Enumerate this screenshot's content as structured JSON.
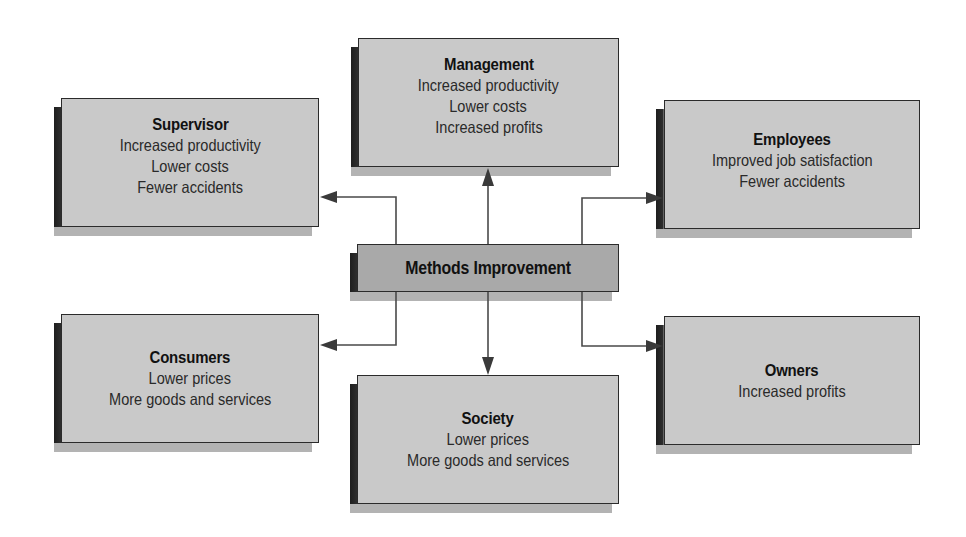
{
  "diagram": {
    "center": {
      "title": "Methods Improvement"
    },
    "nodes": [
      {
        "id": "management",
        "title": "Management",
        "lines": [
          "Increased productivity",
          "Lower costs",
          "Increased profits"
        ]
      },
      {
        "id": "supervisor",
        "title": "Supervisor",
        "lines": [
          "Increased productivity",
          "Lower costs",
          "Fewer accidents"
        ]
      },
      {
        "id": "employees",
        "title": "Employees",
        "lines": [
          "Improved job satisfaction",
          "Fewer accidents"
        ]
      },
      {
        "id": "consumers",
        "title": "Consumers",
        "lines": [
          "Lower prices",
          "More goods and services"
        ]
      },
      {
        "id": "society",
        "title": "Society",
        "lines": [
          "Lower prices",
          "More goods and services"
        ]
      },
      {
        "id": "owners",
        "title": "Owners",
        "lines": [
          "Increased profits"
        ]
      }
    ],
    "edges": [
      {
        "from": "Methods Improvement",
        "to": "Management"
      },
      {
        "from": "Methods Improvement",
        "to": "Supervisor"
      },
      {
        "from": "Methods Improvement",
        "to": "Employees"
      },
      {
        "from": "Methods Improvement",
        "to": "Consumers"
      },
      {
        "from": "Methods Improvement",
        "to": "Society"
      },
      {
        "from": "Methods Improvement",
        "to": "Owners"
      }
    ],
    "colors": {
      "box_fill": "#c9c9c9",
      "center_fill": "#a9a9a9",
      "border": "#2b2b2b",
      "arrow": "#4a4a4a"
    }
  }
}
